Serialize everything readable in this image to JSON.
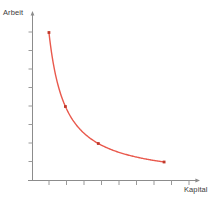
{
  "chart_data": {
    "type": "line",
    "title": "",
    "subtitle": "",
    "xlabel": "Kapital",
    "ylabel": "Arbeit",
    "curve_name": "Isoquante",
    "x": [
      1,
      2,
      4,
      8
    ],
    "y": [
      8,
      4,
      2,
      1
    ],
    "x_smooth_note": "y = 8 / x  (convex hyperbolic isoquant)",
    "xlim": [
      0,
      10
    ],
    "ylim": [
      0,
      9
    ],
    "xticks": [
      1,
      2,
      3,
      4,
      5,
      6,
      7,
      8,
      9
    ],
    "yticks": [
      1,
      2,
      3,
      4,
      5,
      6,
      7,
      8
    ],
    "xticklabels": [
      "",
      "",
      "",
      "",
      "",
      "",
      "",
      "",
      ""
    ],
    "yticklabels": [
      "",
      "",
      "",
      "",
      "",
      "",
      "",
      ""
    ],
    "grid": false,
    "legend": false,
    "legend_position": "none",
    "markers": [
      {
        "x": 1,
        "y": 8
      },
      {
        "x": 2,
        "y": 4
      },
      {
        "x": 4,
        "y": 2
      },
      {
        "x": 8,
        "y": 1
      }
    ],
    "annotations": [],
    "colors": {
      "line": "#e9594d",
      "marker": "#c0392b",
      "axis": "#8c8c8c",
      "tick": "#9a9a9a",
      "text": "#3b3b3b",
      "background": "#ffffff"
    }
  },
  "axes": {
    "y_axis_label": "Arbeit",
    "x_axis_label": "Kapital"
  }
}
